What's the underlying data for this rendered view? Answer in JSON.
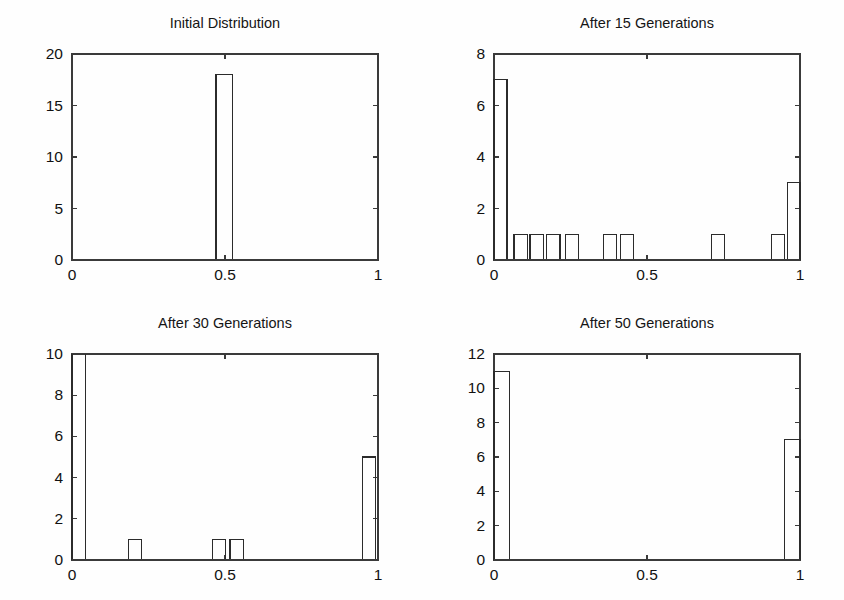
{
  "figure": {
    "width": 844,
    "height": 600,
    "background": "#fefefe",
    "line_color": "#2b2b2b",
    "text_color": "#111111",
    "layout": "2x2 grid of histogram subplots"
  },
  "chart_data": [
    {
      "type": "bar",
      "subplot": "top-left",
      "title": "Initial Distribution",
      "xlabel": "",
      "ylabel": "",
      "xlim": [
        0,
        1
      ],
      "ylim": [
        0,
        20
      ],
      "xticks": [
        0,
        0.5,
        1
      ],
      "xtick_labels": [
        "0",
        "0.5",
        "1"
      ],
      "yticks": [
        0,
        5,
        10,
        15,
        20
      ],
      "ytick_labels": [
        "0",
        "5",
        "10",
        "15",
        "20"
      ],
      "grid": false,
      "legend": "none",
      "bar_fill": "none",
      "bar_edge": "#2b2b2b",
      "bin_width": 0.0333,
      "bars": [
        {
          "center": 0.5,
          "left": 0.4705,
          "right": 0.5235,
          "value": 18
        }
      ]
    },
    {
      "type": "bar",
      "subplot": "top-right",
      "title": "After 15 Generations",
      "xlabel": "",
      "ylabel": "",
      "xlim": [
        0,
        1
      ],
      "ylim": [
        0,
        8
      ],
      "xticks": [
        0,
        0.5,
        1
      ],
      "xtick_labels": [
        "0",
        "0.5",
        "1"
      ],
      "yticks": [
        0,
        2,
        4,
        6,
        8
      ],
      "ytick_labels": [
        "0",
        "2",
        "4",
        "6",
        "8"
      ],
      "grid": false,
      "legend": "none",
      "bar_fill": "none",
      "bar_edge": "#2b2b2b",
      "bin_width": 0.0333,
      "bars": [
        {
          "center": 0.017,
          "left": 0.0,
          "right": 0.0425,
          "value": 7
        },
        {
          "center": 0.085,
          "left": 0.0655,
          "right": 0.1085,
          "value": 1
        },
        {
          "center": 0.137,
          "left": 0.1175,
          "right": 0.1605,
          "value": 1
        },
        {
          "center": 0.192,
          "left": 0.1725,
          "right": 0.2155,
          "value": 1
        },
        {
          "center": 0.254,
          "left": 0.2345,
          "right": 0.2775,
          "value": 1
        },
        {
          "center": 0.378,
          "left": 0.3585,
          "right": 0.4015,
          "value": 1
        },
        {
          "center": 0.432,
          "left": 0.4125,
          "right": 0.4555,
          "value": 1
        },
        {
          "center": 0.73,
          "left": 0.7105,
          "right": 0.7535,
          "value": 1
        },
        {
          "center": 0.925,
          "left": 0.9055,
          "right": 0.9485,
          "value": 1
        },
        {
          "center": 0.978,
          "left": 0.9585,
          "right": 1.0,
          "value": 3
        }
      ]
    },
    {
      "type": "bar",
      "subplot": "bottom-left",
      "title": "After 30 Generations",
      "xlabel": "",
      "ylabel": "",
      "xlim": [
        0,
        1
      ],
      "ylim": [
        0,
        10
      ],
      "xticks": [
        0,
        0.5,
        1
      ],
      "xtick_labels": [
        "0",
        "0.5",
        "1"
      ],
      "yticks": [
        0,
        2,
        4,
        6,
        8,
        10
      ],
      "ytick_labels": [
        "0",
        "2",
        "4",
        "6",
        "8",
        "10"
      ],
      "grid": false,
      "legend": "none",
      "bar_fill": "none",
      "bar_edge": "#2b2b2b",
      "bin_width": 0.0333,
      "note": "first bar exceeds the y-axis maximum and is clipped at 10",
      "bars": [
        {
          "center": 0.019,
          "left": 0.0,
          "right": 0.0455,
          "value": 12,
          "clipped": true
        },
        {
          "center": 0.205,
          "left": 0.1845,
          "right": 0.2275,
          "value": 1
        },
        {
          "center": 0.481,
          "left": 0.4605,
          "right": 0.5015,
          "value": 1
        },
        {
          "center": 0.536,
          "left": 0.5165,
          "right": 0.5595,
          "value": 1
        },
        {
          "center": 0.969,
          "left": 0.9495,
          "right": 0.9925,
          "value": 5
        }
      ]
    },
    {
      "type": "bar",
      "subplot": "bottom-right",
      "title": "After 50 Generations",
      "xlabel": "",
      "ylabel": "",
      "xlim": [
        0,
        1
      ],
      "ylim": [
        0,
        12
      ],
      "xticks": [
        0,
        0.5,
        1
      ],
      "xtick_labels": [
        "0",
        "0.5",
        "1"
      ],
      "yticks": [
        0,
        2,
        4,
        6,
        8,
        10,
        12
      ],
      "ytick_labels": [
        "0",
        "2",
        "4",
        "6",
        "8",
        "10",
        "12"
      ],
      "grid": false,
      "legend": "none",
      "bar_fill": "none",
      "bar_edge": "#2b2b2b",
      "bin_width": 0.0333,
      "bars": [
        {
          "center": 0.021,
          "left": 0.0,
          "right": 0.0495,
          "value": 11
        },
        {
          "center": 0.975,
          "left": 0.9505,
          "right": 1.0,
          "value": 7
        }
      ]
    }
  ]
}
